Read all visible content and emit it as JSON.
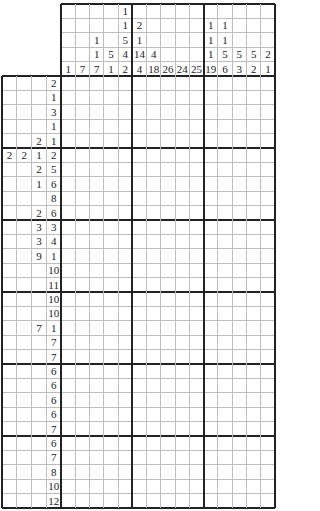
{
  "puzzle": {
    "type": "nonogram",
    "columns": 15,
    "rows": 30,
    "block_size": 5,
    "column_clues": [
      [
        1
      ],
      [
        7
      ],
      [
        1,
        1,
        7
      ],
      [
        5,
        1
      ],
      [
        1,
        1,
        5,
        4,
        2
      ],
      [
        2,
        1,
        14,
        4
      ],
      [
        4,
        18
      ],
      [
        26
      ],
      [
        24
      ],
      [
        25
      ],
      [
        1,
        1,
        1,
        19
      ],
      [
        1,
        1,
        5,
        6
      ],
      [
        5,
        3
      ],
      [
        5,
        2
      ],
      [
        2,
        1
      ]
    ],
    "row_clues": [
      [
        2
      ],
      [
        1
      ],
      [
        3
      ],
      [
        1
      ],
      [
        2,
        1
      ],
      [
        2,
        2,
        1,
        2
      ],
      [
        2,
        5
      ],
      [
        1,
        6
      ],
      [
        8
      ],
      [
        2,
        6
      ],
      [
        3,
        3
      ],
      [
        3,
        4
      ],
      [
        9,
        1
      ],
      [
        10
      ],
      [
        11
      ],
      [
        10
      ],
      [
        10
      ],
      [
        7,
        1
      ],
      [
        7
      ],
      [
        7
      ],
      [
        6
      ],
      [
        6
      ],
      [
        6
      ],
      [
        6
      ],
      [
        7
      ],
      [
        6
      ],
      [
        7
      ],
      [
        8
      ],
      [
        10
      ],
      [
        12
      ]
    ],
    "max_column_clue_depth": 5,
    "max_row_clue_depth": 4
  },
  "colors": {
    "background": "#ffffff",
    "thin_line": "#bdbdbd",
    "thick_line": "#222222",
    "text": "#222222"
  }
}
